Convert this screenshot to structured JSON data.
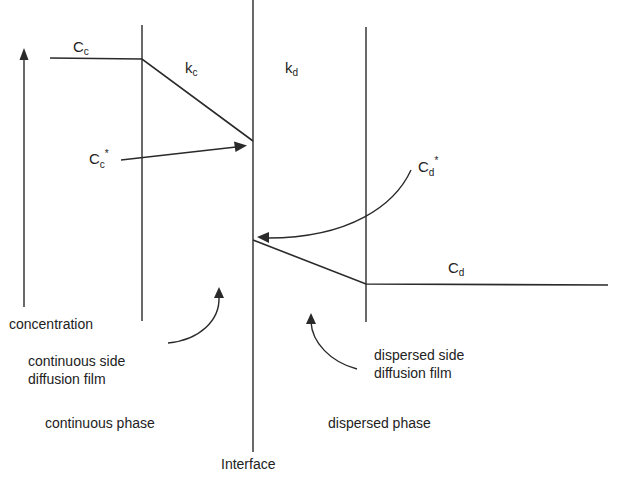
{
  "diagram": {
    "type": "two-film theory of interfacial mass transfer",
    "colors": {
      "ink": "#2a2a2a",
      "background": "#ffffff"
    },
    "axis": {
      "label": "concentration"
    },
    "symbols": {
      "cc": {
        "base": "C",
        "sub": "c",
        "sup": ""
      },
      "kc": {
        "base": "k",
        "sub": "c",
        "sup": ""
      },
      "kd": {
        "base": "k",
        "sub": "d",
        "sup": ""
      },
      "cc_star": {
        "base": "C",
        "sub": "c",
        "sup": "*"
      },
      "cd_star": {
        "base": "C",
        "sub": "d",
        "sup": "*"
      },
      "cd": {
        "base": "C",
        "sub": "d",
        "sup": ""
      }
    },
    "labels": {
      "continuous_film_line1": "continuous side",
      "continuous_film_line2": "diffusion film",
      "dispersed_film_line1": "dispersed side",
      "dispersed_film_line2": "diffusion film",
      "continuous_phase": "continuous phase",
      "dispersed_phase": "dispersed phase",
      "interface": "Interface"
    }
  }
}
